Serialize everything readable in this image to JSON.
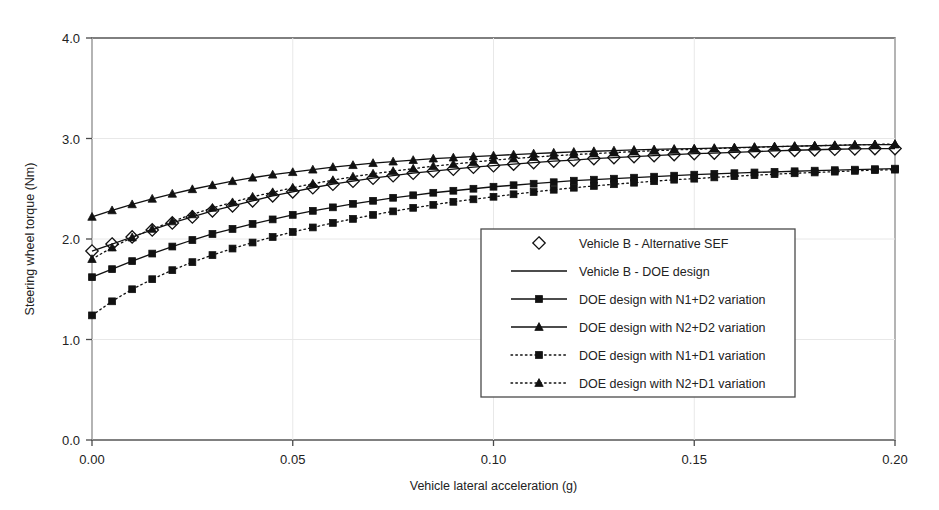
{
  "chart_data": {
    "type": "line",
    "title": "",
    "xlabel": "Vehicle lateral acceleration (g)",
    "ylabel": "Steering wheel torque (Nm)",
    "xlim": [
      0.0,
      0.2
    ],
    "ylim": [
      0.0,
      4.0
    ],
    "xticks": [
      0.0,
      0.05,
      0.1,
      0.15,
      0.2
    ],
    "xtick_labels": [
      "0.00",
      "0.05",
      "0.10",
      "0.15",
      "0.20"
    ],
    "yticks": [
      0.0,
      1.0,
      2.0,
      3.0,
      4.0
    ],
    "ytick_labels": [
      "0.0",
      "1.0",
      "2.0",
      "3.0",
      "4.0"
    ],
    "grid": false,
    "legend_position": "center-right-inside",
    "x": [
      0.0,
      0.005,
      0.01,
      0.015,
      0.02,
      0.025,
      0.03,
      0.035,
      0.04,
      0.045,
      0.05,
      0.055,
      0.06,
      0.065,
      0.07,
      0.075,
      0.08,
      0.085,
      0.09,
      0.095,
      0.1,
      0.105,
      0.11,
      0.115,
      0.12,
      0.125,
      0.13,
      0.135,
      0.14,
      0.145,
      0.15,
      0.155,
      0.16,
      0.165,
      0.17,
      0.175,
      0.18,
      0.185,
      0.19,
      0.195,
      0.2
    ],
    "series": [
      {
        "name": "Vehicle B - Alternative SEF",
        "marker": "diamond-open",
        "line": "none",
        "values": [
          1.88,
          1.95,
          2.02,
          2.09,
          2.16,
          2.22,
          2.28,
          2.33,
          2.38,
          2.43,
          2.47,
          2.51,
          2.545,
          2.575,
          2.605,
          2.63,
          2.655,
          2.675,
          2.695,
          2.715,
          2.73,
          2.745,
          2.76,
          2.775,
          2.785,
          2.8,
          2.81,
          2.82,
          2.83,
          2.84,
          2.85,
          2.855,
          2.862,
          2.87,
          2.877,
          2.883,
          2.888,
          2.893,
          2.897,
          2.9,
          2.9
        ]
      },
      {
        "name": "Vehicle B - DOE design",
        "marker": "none",
        "line": "solid",
        "values": [
          1.88,
          1.95,
          2.02,
          2.09,
          2.16,
          2.22,
          2.28,
          2.33,
          2.38,
          2.43,
          2.47,
          2.51,
          2.545,
          2.575,
          2.605,
          2.63,
          2.655,
          2.675,
          2.695,
          2.715,
          2.73,
          2.745,
          2.76,
          2.775,
          2.785,
          2.8,
          2.81,
          2.82,
          2.83,
          2.84,
          2.85,
          2.855,
          2.862,
          2.87,
          2.877,
          2.883,
          2.888,
          2.893,
          2.897,
          2.9,
          2.9
        ]
      },
      {
        "name": "DOE design with N1+D2 variation",
        "marker": "square-filled",
        "line": "solid",
        "values": [
          1.62,
          1.7,
          1.78,
          1.855,
          1.925,
          1.99,
          2.05,
          2.1,
          2.15,
          2.195,
          2.24,
          2.28,
          2.315,
          2.35,
          2.38,
          2.41,
          2.435,
          2.46,
          2.48,
          2.5,
          2.52,
          2.535,
          2.55,
          2.565,
          2.58,
          2.59,
          2.6,
          2.61,
          2.62,
          2.63,
          2.64,
          2.648,
          2.655,
          2.662,
          2.668,
          2.674,
          2.68,
          2.685,
          2.69,
          2.695,
          2.7
        ]
      },
      {
        "name": "DOE design with N2+D2 variation",
        "marker": "triangle-filled",
        "line": "solid",
        "values": [
          2.22,
          2.285,
          2.345,
          2.4,
          2.45,
          2.495,
          2.535,
          2.575,
          2.61,
          2.64,
          2.665,
          2.69,
          2.715,
          2.735,
          2.755,
          2.77,
          2.785,
          2.8,
          2.81,
          2.82,
          2.83,
          2.84,
          2.85,
          2.858,
          2.866,
          2.873,
          2.88,
          2.886,
          2.891,
          2.896,
          2.9,
          2.905,
          2.91,
          2.915,
          2.92,
          2.924,
          2.928,
          2.932,
          2.936,
          2.94,
          2.94
        ]
      },
      {
        "name": "DOE design with N1+D1 variation",
        "marker": "square-filled",
        "line": "dotted",
        "values": [
          1.24,
          1.38,
          1.5,
          1.6,
          1.69,
          1.77,
          1.84,
          1.905,
          1.965,
          2.02,
          2.07,
          2.115,
          2.16,
          2.2,
          2.24,
          2.275,
          2.31,
          2.34,
          2.37,
          2.395,
          2.42,
          2.445,
          2.468,
          2.49,
          2.51,
          2.528,
          2.545,
          2.56,
          2.575,
          2.59,
          2.6,
          2.613,
          2.625,
          2.635,
          2.645,
          2.654,
          2.662,
          2.67,
          2.678,
          2.685,
          2.69
        ]
      },
      {
        "name": "DOE design with N2+D1 variation",
        "marker": "triangle-filled",
        "line": "dotted",
        "values": [
          1.8,
          1.915,
          2.015,
          2.1,
          2.175,
          2.245,
          2.31,
          2.365,
          2.42,
          2.465,
          2.51,
          2.55,
          2.585,
          2.62,
          2.65,
          2.675,
          2.7,
          2.725,
          2.745,
          2.765,
          2.785,
          2.8,
          2.815,
          2.828,
          2.84,
          2.85,
          2.86,
          2.87,
          2.878,
          2.886,
          2.893,
          2.9,
          2.906,
          2.912,
          2.918,
          2.923,
          2.928,
          2.933,
          2.937,
          2.941,
          2.945
        ]
      }
    ],
    "legend": [
      {
        "label": "Vehicle B - Alternative SEF",
        "marker": "diamond-open",
        "line": "none"
      },
      {
        "label": "Vehicle B - DOE design",
        "marker": "none",
        "line": "solid"
      },
      {
        "label": "DOE design with N1+D2 variation",
        "marker": "square-filled",
        "line": "solid"
      },
      {
        "label": "DOE design with N2+D2 variation",
        "marker": "triangle-filled",
        "line": "solid"
      },
      {
        "label": "DOE design with N1+D1 variation",
        "marker": "square-filled",
        "line": "dotted"
      },
      {
        "label": "DOE design with N2+D1 variation",
        "marker": "triangle-filled",
        "line": "dotted"
      }
    ],
    "colors": {
      "line": "#111111",
      "frame": "#4a4a4a",
      "background": "#ffffff"
    }
  }
}
